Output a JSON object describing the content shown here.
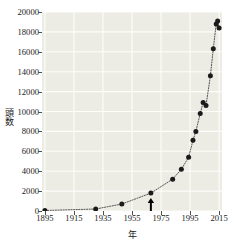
{
  "chart_data": {
    "type": "scatter",
    "title": "",
    "xlabel": "年",
    "ylabel": "頭数",
    "xlim": [
      1893,
      2017
    ],
    "ylim": [
      0,
      20000
    ],
    "xticks": [
      1895,
      1915,
      1935,
      1955,
      1975,
      1995,
      2015
    ],
    "xtick_labels": [
      "1895",
      "1915",
      "1935",
      "1955",
      "1975",
      "1995",
      "2015"
    ],
    "yticks": [
      0,
      2000,
      4000,
      6000,
      8000,
      10000,
      12000,
      14000,
      16000,
      18000,
      20000
    ],
    "ytick_labels": [
      "0",
      "2000",
      "4000",
      "6000",
      "8000",
      "10000",
      "12000",
      "14000",
      "16000",
      "18000",
      "20000"
    ],
    "grid": true,
    "grid_color": "#fdfdfa",
    "plot_background": "#edece4",
    "marker_color": "#1a1a1a",
    "line_style": "dotted",
    "line_color": "#555555",
    "x": [
      1895,
      1930,
      1948,
      1968,
      1983,
      1989,
      1994,
      1997,
      1999,
      2002,
      2004,
      2006,
      2009,
      2011,
      2013,
      2014,
      2015
    ],
    "y": [
      50,
      200,
      700,
      1800,
      3200,
      4200,
      5400,
      7100,
      8000,
      9800,
      10900,
      10600,
      13600,
      16300,
      18800,
      19100,
      18400
    ],
    "annotations": [
      {
        "type": "arrow-up",
        "x": 1968,
        "y": 0,
        "label": ""
      }
    ]
  },
  "axes": {
    "ylabel": "頭数",
    "xlabel": "年"
  }
}
